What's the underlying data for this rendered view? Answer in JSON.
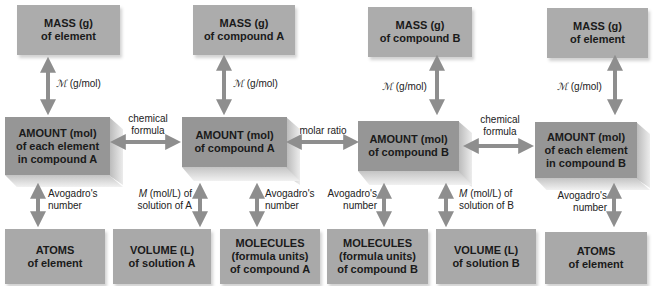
{
  "top_boxes": [
    {
      "line1": "MASS (g)",
      "line2": "of element"
    },
    {
      "line1": "MASS (g)",
      "line2": "of compound A"
    },
    {
      "line1": "MASS (g)",
      "line2": "of compound B"
    },
    {
      "line1": "MASS (g)",
      "line2": "of element"
    }
  ],
  "amount_boxes": [
    {
      "line1": "AMOUNT (mol)",
      "line2": "of each element",
      "line3": "in compound A"
    },
    {
      "line1": "AMOUNT (mol)",
      "line2": "of compound A"
    },
    {
      "line1": "AMOUNT (mol)",
      "line2": "of compound B"
    },
    {
      "line1": "AMOUNT (mol)",
      "line2": "of each element",
      "line3": "in compound B"
    }
  ],
  "bottom_boxes": [
    {
      "line1": "ATOMS",
      "line2": "of element"
    },
    {
      "line1": "VOLUME (L)",
      "line2": "of solution A"
    },
    {
      "line1": "MOLECULES",
      "line2": "(formula units)",
      "line3": "of compound A"
    },
    {
      "line1": "MOLECULES",
      "line2": "(formula units)",
      "line3": "of compound B"
    },
    {
      "line1": "VOLUME (L)",
      "line2": "of solution B"
    },
    {
      "line1": "ATOMS",
      "line2": "of element"
    }
  ],
  "vertical_labels": {
    "molar_mass_symbol": "ℳ",
    "molar_mass_unit": "(g/mol)",
    "avogadro_line1": "Avogadro's",
    "avogadro_line2": "number",
    "molarity_symbol": "M",
    "molarity_A_line1": "(mol/L) of",
    "molarity_A_line2": "solution of A",
    "molarity_B_line1": "(mol/L) of",
    "molarity_B_line2": "solution of B"
  },
  "horizontal_labels": {
    "chemical_formula_line1": "chemical",
    "chemical_formula_line2": "formula",
    "molar_ratio": "molar ratio"
  },
  "colors": {
    "box_fill": "#acacac",
    "amount_box_fill": "#969696",
    "arrow": "#8e8e8e",
    "text": "#1a1a1a"
  }
}
